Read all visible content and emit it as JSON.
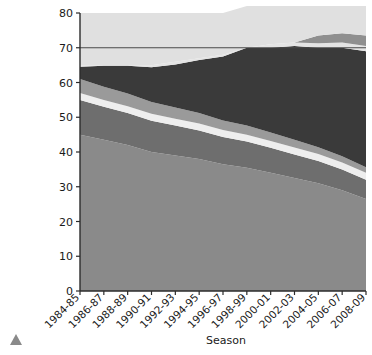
{
  "chart_data": {
    "type": "area",
    "title": "",
    "subtitle": "",
    "xlabel": "Season",
    "ylabel": "",
    "stacked": true,
    "grid": false,
    "legend": "none",
    "xlim_categories_count": 13,
    "ylim": [
      0,
      80
    ],
    "ytick_step": 10,
    "yticks": [
      "0",
      "10",
      "20",
      "30",
      "40",
      "50",
      "60",
      "70",
      "80"
    ],
    "categories": [
      "1984-85",
      "1986-87",
      "1988-89",
      "1990-91",
      "1992-93",
      "1994-95",
      "1996-97",
      "1998-99",
      "2000-01",
      "2002-03",
      "2004-05",
      "2006-07",
      "2008-09"
    ],
    "reference_line": {
      "value": 70,
      "color": "#4a4a4a"
    },
    "series": [
      {
        "name": "band-1-bottom",
        "color": "#8a8a8a",
        "values": [
          45.0,
          43.5,
          42.0,
          40.0,
          39.0,
          38.0,
          36.5,
          35.5,
          34.0,
          32.5,
          31.0,
          29.0,
          26.5
        ]
      },
      {
        "name": "band-2",
        "color": "#6e6e6e",
        "values": [
          10.0,
          9.5,
          9.2,
          9.0,
          8.6,
          8.2,
          7.8,
          7.5,
          7.2,
          6.8,
          6.4,
          6.0,
          5.5
        ]
      },
      {
        "name": "band-3-light",
        "color": "#eeeeee",
        "values": [
          2.0,
          2.0,
          2.0,
          2.0,
          2.0,
          2.0,
          2.0,
          2.0,
          2.0,
          2.0,
          2.0,
          2.0,
          2.0
        ]
      },
      {
        "name": "band-4",
        "color": "#9a9a9a",
        "values": [
          4.0,
          3.8,
          3.6,
          3.4,
          3.2,
          3.0,
          2.8,
          2.6,
          2.4,
          2.2,
          2.0,
          1.8,
          1.6
        ]
      },
      {
        "name": "band-5-dark",
        "color": "#3a3a3a",
        "values": [
          3.5,
          6.0,
          8.0,
          10.0,
          12.4,
          15.3,
          18.4,
          22.4,
          24.4,
          27.0,
          28.6,
          31.2,
          33.4
        ]
      },
      {
        "name": "band-6-light-mid",
        "color": "#e4e4e4",
        "values": [
          0.5,
          0.2,
          0.2,
          0.6,
          0.8,
          0.5,
          0.5,
          0.0,
          1.0,
          1.0,
          1.3,
          1.5,
          1.5
        ]
      },
      {
        "name": "band-7-grey-upper",
        "color": "#8f8f8f",
        "values": [
          0.0,
          0.0,
          0.0,
          0.0,
          0.0,
          0.0,
          0.0,
          0.0,
          0.0,
          0.0,
          2.2,
          2.7,
          3.0
        ]
      },
      {
        "name": "band-8-top",
        "color": "#e0e0e0",
        "values": [
          15.0,
          15.0,
          15.0,
          15.0,
          14.0,
          13.0,
          12.0,
          12.0,
          11.0,
          10.5,
          8.5,
          7.8,
          8.5
        ]
      }
    ]
  },
  "marker": {
    "name": "scroll-up-triangle"
  }
}
